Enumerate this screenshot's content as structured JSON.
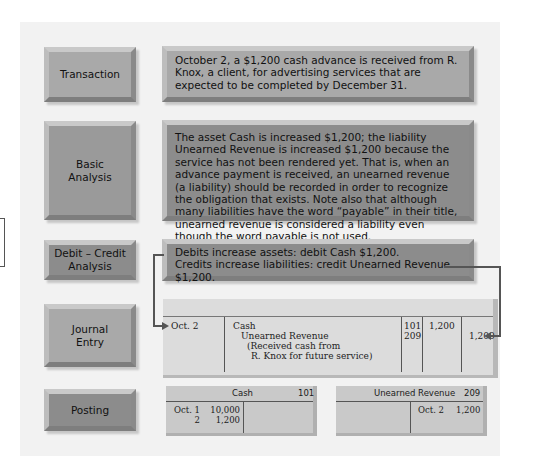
{
  "rows": [
    {
      "label": "Transaction",
      "text": "October 2, a $1,200 cash advance is received from R. Knox, a client, for advertising services that are expected to be completed by December 31."
    },
    {
      "label_line1": "Basic",
      "label_line2": "Analysis",
      "text": "The asset Cash is increased $1,200; the liability Unearned Revenue is increased $1,200 because the service has not been rendered yet. That is, when an advance payment is received, an unearned revenue (a liability) should be recorded in order to recognize the obligation that exists. Note also that although many liabilities have the word “payable” in their title, unearned revenue is considered a liability even though the word payable is not used."
    },
    {
      "label_line1": "Debit – Credit",
      "label_line2": "Analysis",
      "line1": "Debits increase assets: debit Cash $1,200.",
      "line2": "Credits increase liabilities: credit Unearned Revenue $1,200."
    },
    {
      "label_line1": "Journal",
      "label_line2": "Entry"
    },
    {
      "label": "Posting"
    }
  ],
  "journal": {
    "date": "Oct. 2",
    "lines": [
      "Cash",
      "Unearned Revenue",
      "(Received cash from",
      "R. Knox for future service)"
    ],
    "refs": [
      "101",
      "209"
    ],
    "debit": "1,200",
    "credit": "1,200"
  },
  "ledger": {
    "cash": {
      "title": "Cash",
      "number": "101",
      "debit_dates": [
        "Oct. 1",
        "2"
      ],
      "debit_amounts": [
        "10,000",
        "1,200"
      ]
    },
    "unearned": {
      "title": "Unearned Revenue",
      "number": "209",
      "credit_date": "Oct. 2",
      "credit_amount": "1,200"
    }
  },
  "colors": {
    "panel": "#f2f2f2",
    "box_dark": "#8c8c8c",
    "box_light": "#a9a9a9",
    "journal_bg": "#dcdcdc",
    "connector": "#555555"
  }
}
